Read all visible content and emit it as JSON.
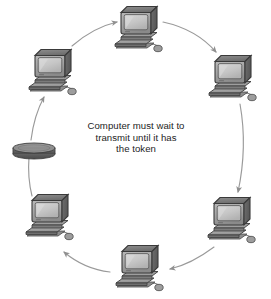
{
  "diagram": {
    "type": "token-ring-network",
    "caption": {
      "lines": [
        "Computer must wait to",
        "transmit until it has",
        "the token"
      ],
      "text": "Computer must wait to\ntransmit until it has\nthe token",
      "color": "#1d1d1d"
    },
    "ring": {
      "center_x": 134,
      "center_y": 148,
      "radius_x": 100,
      "radius_y": 112,
      "direction": "clockwise",
      "line_color": "#9a9a9a"
    },
    "token": {
      "label": "token",
      "shape": "disc",
      "x": 34,
      "y": 148,
      "width": 42,
      "height": 13,
      "top_color": "#8e8e8e",
      "side_color": "#6a6a6a"
    },
    "nodes": [
      {
        "id": "node-top",
        "label": "computer",
        "x": 137,
        "y": 30
      },
      {
        "id": "node-top-right",
        "label": "computer",
        "x": 231,
        "y": 79
      },
      {
        "id": "node-bottom-right",
        "label": "computer",
        "x": 230,
        "y": 221
      },
      {
        "id": "node-bottom",
        "label": "computer",
        "x": 138,
        "y": 269
      },
      {
        "id": "node-bottom-left",
        "label": "computer",
        "x": 48,
        "y": 218
      },
      {
        "id": "node-top-left",
        "label": "computer",
        "x": 51,
        "y": 73
      }
    ],
    "colors": {
      "background": "#ffffff",
      "monitor_case_light": "#b7b7b7",
      "monitor_case_mid": "#8f8f8f",
      "monitor_case_dark": "#5f5f5f",
      "screen": "#c9c9c9",
      "outline": "#3a3a3a",
      "arrow": "#8f8f8f"
    },
    "arrows": [
      {
        "from": "node-top-left",
        "to": "node-top",
        "direction": "clockwise"
      },
      {
        "from": "node-top",
        "to": "node-top-right",
        "direction": "clockwise"
      },
      {
        "from": "node-top-right",
        "to": "node-bottom-right",
        "direction": "clockwise"
      },
      {
        "from": "node-bottom-right",
        "to": "node-bottom",
        "direction": "clockwise"
      },
      {
        "from": "node-bottom",
        "to": "node-bottom-left",
        "direction": "clockwise"
      },
      {
        "from": "node-bottom-left",
        "to": "token",
        "direction": "clockwise"
      },
      {
        "from": "token",
        "to": "node-top-left",
        "direction": "clockwise"
      }
    ]
  }
}
